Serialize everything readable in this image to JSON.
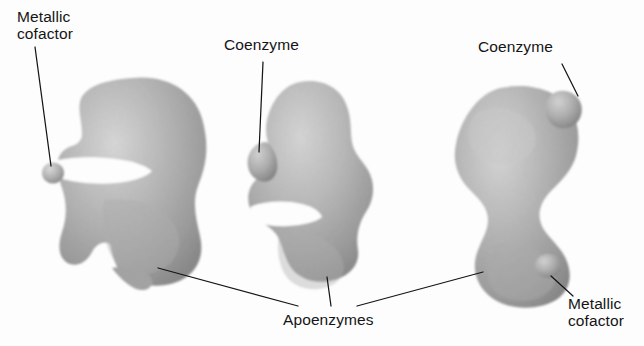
{
  "figure": {
    "background_color": "#fdfdfd",
    "ink_color": "#151515",
    "body_fill_light": "#c9c9c9",
    "body_fill_mid": "#b0b0b0",
    "body_fill_dark": "#8a8a8a",
    "edge_color": "#707070"
  },
  "labels": {
    "metallic_cofactor_left": "Metallic\ncofactor",
    "coenzyme_middle": "Coenzyme",
    "coenzyme_right": "Coenzyme",
    "apoenzymes": "Apoenzymes",
    "metallic_cofactor_right": "Metallic\ncofactor"
  },
  "structures": [
    {
      "name": "left-apoenzyme",
      "label": "Apoenzymes",
      "has_metallic_cofactor": true,
      "has_coenzyme": false,
      "cofactor_position": "left-cleft-detached"
    },
    {
      "name": "middle-apoenzyme",
      "label": "Apoenzymes",
      "has_metallic_cofactor": false,
      "has_coenzyme": true,
      "coenzyme_position": "upper-left-attached"
    },
    {
      "name": "right-apoenzyme",
      "label": "Apoenzymes",
      "has_metallic_cofactor": true,
      "has_coenzyme": true,
      "coenzyme_position": "top-right-attached",
      "cofactor_position": "bottom-right-attached"
    }
  ]
}
